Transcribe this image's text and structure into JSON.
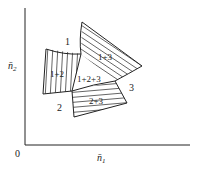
{
  "axes": {
    "origin_label": "0",
    "x_label": "n̄",
    "x_sub": "1",
    "y_label": "n̄",
    "y_sub": "2"
  },
  "regions": [
    {
      "id": "1",
      "label": "1",
      "hatched": false
    },
    {
      "id": "2",
      "label": "2",
      "hatched": false
    },
    {
      "id": "3",
      "label": "3",
      "hatched": false
    },
    {
      "id": "1+2",
      "label": "1+2",
      "hatched": true,
      "hatch": "vertical"
    },
    {
      "id": "1+3",
      "label": "1+3",
      "hatched": true,
      "hatch": "horizontal-diagonal"
    },
    {
      "id": "2+3",
      "label": "2+3",
      "hatched": true,
      "hatch": "horizontal"
    },
    {
      "id": "1+2+3",
      "label": "1+2+3",
      "hatched": false
    }
  ],
  "colors": {
    "ink": "#222222",
    "background": "#ffffff"
  }
}
